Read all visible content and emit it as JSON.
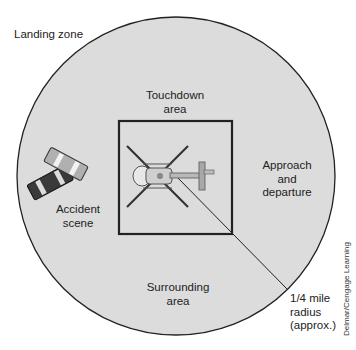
{
  "diagram": {
    "title": "Landing zone",
    "labels": {
      "landing_zone": "Landing zone",
      "touchdown_line1": "Touchdown",
      "touchdown_line2": "area",
      "approach_line1": "Approach",
      "approach_line2": "and",
      "approach_line3": "departure",
      "accident_line1": "Accident",
      "accident_line2": "scene",
      "surrounding_line1": "Surrounding",
      "surrounding_line2": "area",
      "radius_line1": "1/4 mile",
      "radius_line2": "radius",
      "radius_line3": "(approx.)"
    },
    "credit": "Delmar/Cengage Learning",
    "colors": {
      "zone_fill": "#dcdcdc",
      "outline": "#222222",
      "car_dark": "#3a3a3a",
      "car_light": "#b0b0b0",
      "heli": "#9a9a9a"
    }
  }
}
